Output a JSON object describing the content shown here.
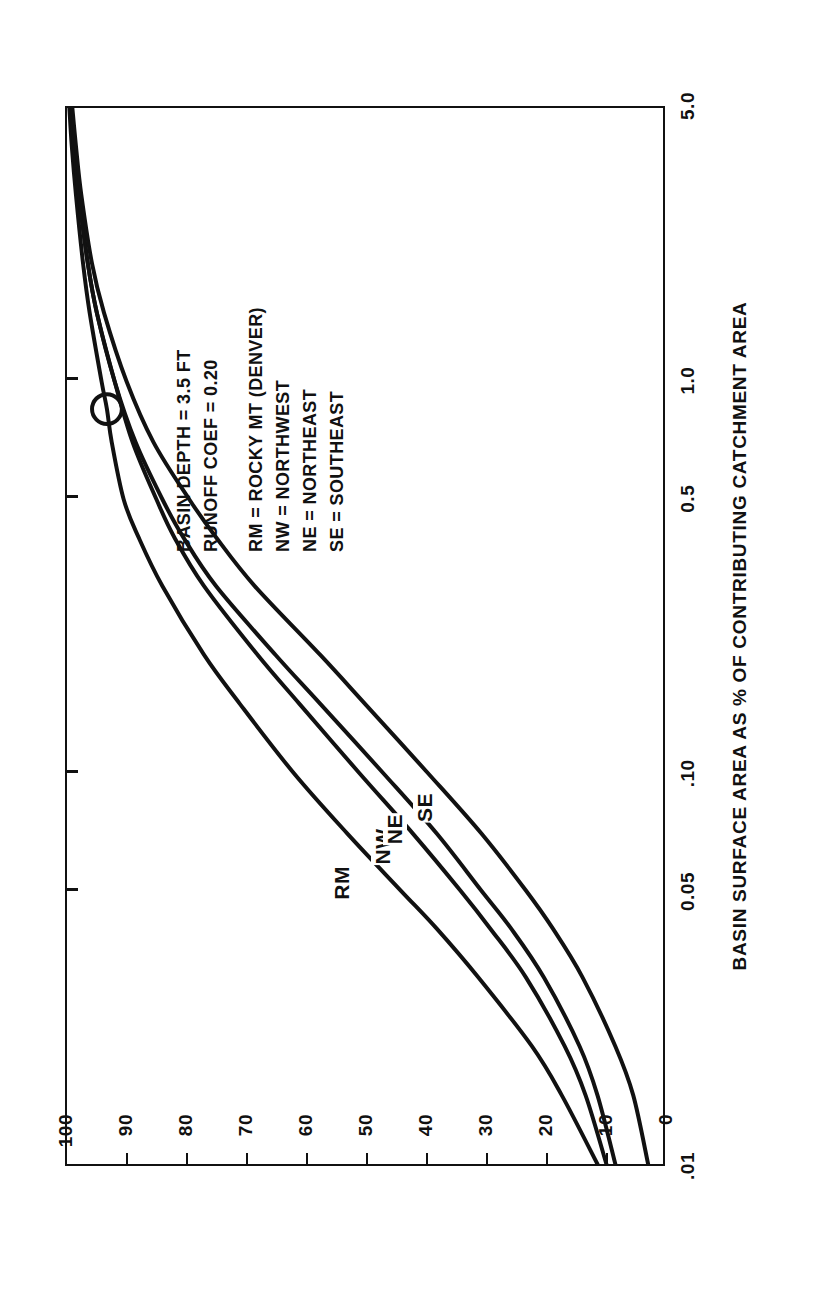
{
  "figure": {
    "background_color": "#ffffff",
    "ink_color": "#111111",
    "orientation": "rotated-90-ccw"
  },
  "chart_data": {
    "type": "line",
    "title": "",
    "xlabel": "BASIN SURFACE AREA AS % OF CONTRIBUTING CATCHMENT AREA",
    "ylabel_line1": "LONG TERM AVERAGE",
    "ylabel_line2": "% REMOVAL OF URBAN RUNOFF TSS",
    "x_scale": "log",
    "xlim": [
      0.01,
      5.0
    ],
    "ylim": [
      0,
      100
    ],
    "xticks": [
      0.01,
      0.05,
      0.1,
      0.5,
      1.0,
      5.0
    ],
    "xtick_labels": [
      ".01",
      "0.05",
      ".10",
      "0.5",
      "1.0",
      "5.0"
    ],
    "yticks": [
      0,
      10,
      20,
      30,
      40,
      50,
      60,
      70,
      80,
      90,
      100
    ],
    "ytick_labels": [
      "0",
      "10",
      "20",
      "30",
      "40",
      "50",
      "60",
      "70",
      "80",
      "90",
      "100"
    ],
    "grid": false,
    "legend_position": "inline-curve-labels",
    "series": [
      {
        "name": "RM",
        "label": "RM",
        "description": "ROCKY MT (DENVER)",
        "x": [
          0.01,
          0.015,
          0.02,
          0.03,
          0.04,
          0.05,
          0.07,
          0.1,
          0.15,
          0.2,
          0.3,
          0.4,
          0.5,
          0.7,
          0.85,
          1.0,
          1.5,
          2.0,
          3.0,
          4.0,
          5.0
        ],
        "y": [
          11,
          17,
          22,
          31,
          38,
          44,
          53,
          62,
          71,
          77,
          84,
          88,
          90.5,
          92.5,
          93.3,
          94.2,
          96.2,
          97.3,
          98.5,
          99.2,
          99.6
        ]
      },
      {
        "name": "NW",
        "label": "NW",
        "description": "NORTHWEST",
        "x": [
          0.01,
          0.015,
          0.02,
          0.03,
          0.04,
          0.05,
          0.07,
          0.1,
          0.15,
          0.2,
          0.3,
          0.4,
          0.5,
          0.7,
          1.0,
          1.5,
          2.0,
          3.0,
          4.0,
          5.0
        ],
        "y": [
          9.5,
          13,
          16.5,
          23,
          29,
          34,
          42,
          51,
          61,
          68,
          77,
          82,
          85,
          89,
          92,
          95,
          96.5,
          98,
          98.8,
          99.3
        ]
      },
      {
        "name": "NE",
        "label": "NE",
        "description": "NORTHEAST",
        "x": [
          0.01,
          0.015,
          0.02,
          0.03,
          0.04,
          0.05,
          0.07,
          0.1,
          0.15,
          0.2,
          0.3,
          0.4,
          0.5,
          0.7,
          1.0,
          1.5,
          2.0,
          3.0,
          4.0,
          5.0
        ],
        "y": [
          8,
          11,
          14,
          20,
          25.5,
          30.5,
          38,
          47,
          57.5,
          65,
          75,
          80.5,
          84,
          88.5,
          92,
          95,
          96.5,
          98,
          98.8,
          99.3
        ]
      },
      {
        "name": "SE",
        "label": "SE",
        "description": "SOUTHEAST",
        "x": [
          0.01,
          0.015,
          0.02,
          0.03,
          0.04,
          0.05,
          0.07,
          0.1,
          0.15,
          0.2,
          0.3,
          0.4,
          0.5,
          0.7,
          1.0,
          1.5,
          2.0,
          3.0,
          4.0,
          5.0
        ],
        "y": [
          2.5,
          5,
          8,
          13.5,
          18.5,
          23,
          30.5,
          39.5,
          50,
          57.5,
          68.5,
          75,
          79.5,
          85.5,
          90,
          93.8,
          95.8,
          97.6,
          98.5,
          99.1
        ]
      }
    ],
    "markers": [
      {
        "name": "design-point",
        "shape": "circle",
        "series": "RM",
        "x": 0.85,
        "y": 93.3
      }
    ],
    "annotations": [
      "BASIN DEPTH = 3.5 FT",
      "RUNOFF COEF = 0.20",
      "",
      "RM = ROCKY MT (DENVER)",
      "NW = NORTHWEST",
      "NE = NORTHEAST",
      "SE = SOUTHEAST"
    ]
  }
}
